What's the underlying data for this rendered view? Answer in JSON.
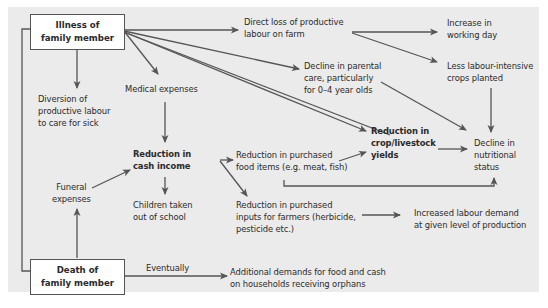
{
  "diagram": {
    "colors": {
      "panel_bg": "#ebebeb",
      "box_bg": "#ffffff",
      "arrow": "#555555",
      "text": "#2a2a2a"
    },
    "nodes": {
      "illness": {
        "lines": [
          "Illness of",
          "family member"
        ],
        "boxed": true
      },
      "death": {
        "lines": [
          "Death of",
          "family member"
        ],
        "boxed": true
      },
      "diversion": {
        "lines": [
          "Diversion of",
          "productive labour",
          "to care for sick"
        ]
      },
      "medical": {
        "lines": [
          "Medical expenses"
        ]
      },
      "direct_loss": {
        "lines": [
          "Direct loss of productive",
          "labour on farm"
        ]
      },
      "increase_day": {
        "lines": [
          "Increase in",
          "working day"
        ]
      },
      "less_labour": {
        "lines": [
          "Less labour-intensive",
          "crops planted"
        ]
      },
      "parental": {
        "lines": [
          "Decline in parental",
          "care, particularly",
          "for 0–4 year olds"
        ]
      },
      "cash_income": {
        "lines": [
          "Reduction in",
          "cash income"
        ],
        "bold": true
      },
      "crop_yields": {
        "lines": [
          "Reduction in",
          "crop/livestock",
          "yields"
        ],
        "bold": true
      },
      "food_items": {
        "lines": [
          "Reduction in purchased",
          "food items (e.g. meat, fish)"
        ]
      },
      "nutrition": {
        "lines": [
          "Decline in",
          "nutritional",
          "status"
        ]
      },
      "funeral": {
        "lines": [
          "Funeral",
          "expenses"
        ]
      },
      "school": {
        "lines": [
          "Children taken",
          "out of school"
        ]
      },
      "inputs": {
        "lines": [
          "Reduction in purchased",
          "inputs for farmers (herbicide,",
          "pesticide etc.)"
        ]
      },
      "labour_demand": {
        "lines": [
          "Increased labour demand",
          "at given level of production"
        ]
      },
      "orphans": {
        "lines": [
          "Additional demands for food and cash",
          "on households receiving orphans"
        ]
      }
    },
    "edge_labels": {
      "eventually": "Eventually"
    },
    "edges": [
      [
        "illness",
        "direct_loss"
      ],
      [
        "illness",
        "diversion"
      ],
      [
        "illness",
        "medical"
      ],
      [
        "illness",
        "parental"
      ],
      [
        "illness",
        "crop_yields"
      ],
      [
        "illness",
        "nutrition_via_left_bracket"
      ],
      [
        "direct_loss",
        "increase_day"
      ],
      [
        "direct_loss",
        "less_labour"
      ],
      [
        "less_labour",
        "nutrition"
      ],
      [
        "parental",
        "nutrition"
      ],
      [
        "medical",
        "cash_income"
      ],
      [
        "funeral",
        "cash_income"
      ],
      [
        "death",
        "funeral"
      ],
      [
        "cash_income",
        "food_items"
      ],
      [
        "cash_income",
        "school"
      ],
      [
        "cash_income",
        "inputs"
      ],
      [
        "food_items",
        "crop_yields"
      ],
      [
        "food_items",
        "nutrition"
      ],
      [
        "crop_yields",
        "nutrition"
      ],
      [
        "inputs",
        "labour_demand"
      ],
      [
        "death",
        "orphans"
      ]
    ]
  }
}
